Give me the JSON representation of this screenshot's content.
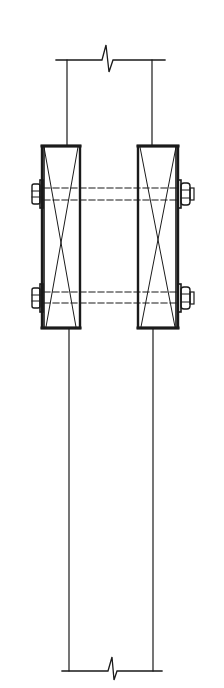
{
  "diagram": {
    "colors": {
      "line": "#1a1a1a",
      "background": "#ffffff"
    },
    "members": [
      {
        "id": "left-block",
        "x": 41,
        "y": 146,
        "w": 39,
        "h": 182
      },
      {
        "id": "right-block",
        "x": 138,
        "y": 146,
        "w": 40,
        "h": 182
      }
    ],
    "posts": [
      {
        "id": "left-post",
        "x": 67
      },
      {
        "id": "right-post",
        "x": 152
      }
    ],
    "bolts": [
      {
        "id": "upper-bolt",
        "y1": 188,
        "y2": 200
      },
      {
        "id": "lower-bolt",
        "y1": 292,
        "y2": 303
      }
    ],
    "break_lines": [
      {
        "id": "top-break",
        "y": 60,
        "x1": 56,
        "x2": 165,
        "bx": 108
      },
      {
        "id": "bottom-break",
        "y": 671,
        "x1": 62,
        "x2": 162,
        "bx": 112
      }
    ]
  }
}
